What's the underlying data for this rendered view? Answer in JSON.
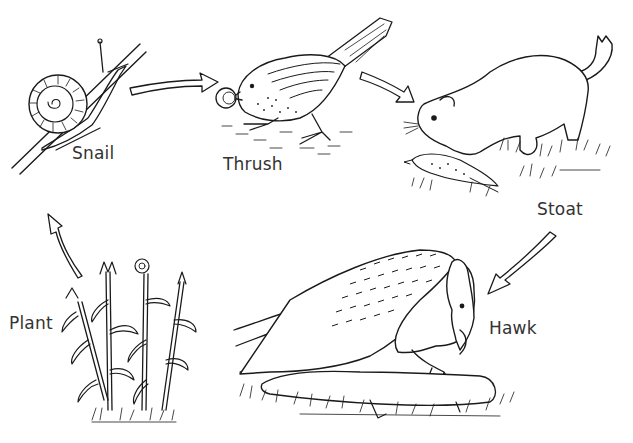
{
  "organisms": [
    {
      "id": "snail",
      "label": "Snail",
      "role": "primary consumer"
    },
    {
      "id": "thrush",
      "label": "Thrush",
      "role": "secondary consumer"
    },
    {
      "id": "stoat",
      "label": "Stoat",
      "role": "tertiary consumer"
    },
    {
      "id": "hawk",
      "label": "Hawk",
      "role": "apex predator"
    },
    {
      "id": "plant",
      "label": "Plant",
      "role": "producer"
    }
  ],
  "arrows": [
    {
      "from": "snail",
      "to": "thrush"
    },
    {
      "from": "thrush",
      "to": "stoat"
    },
    {
      "from": "stoat",
      "to": "hawk"
    },
    {
      "from": "plant",
      "to": "snail"
    }
  ],
  "colors": {
    "ink": "#1a1a1a",
    "label": "#333333",
    "background": "#ffffff"
  }
}
